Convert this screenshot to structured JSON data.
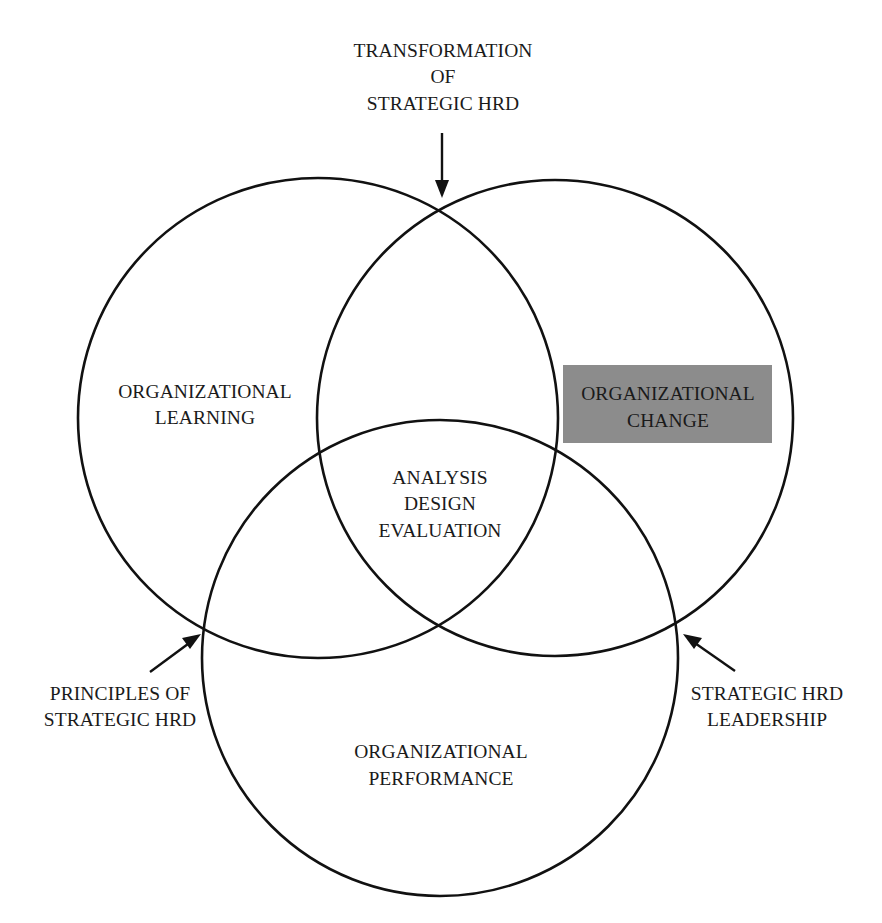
{
  "diagram": {
    "type": "venn",
    "circles": [
      {
        "id": "learning",
        "label_lines": [
          "ORGANIZATIONAL",
          "LEARNING"
        ],
        "cx": 318,
        "cy": 418,
        "r": 240
      },
      {
        "id": "change",
        "label_lines": [
          "ORGANIZATIONAL",
          "CHANGE"
        ],
        "cx": 555,
        "cy": 418,
        "r": 238,
        "highlighted": true
      },
      {
        "id": "performance",
        "label_lines": [
          "ORGANIZATIONAL",
          "PERFORMANCE"
        ],
        "cx": 440,
        "cy": 658,
        "r": 238
      }
    ],
    "center": {
      "label_lines": [
        "ANALYSIS",
        "DESIGN",
        "EVALUATION"
      ]
    },
    "annotations": {
      "top": {
        "label_lines": [
          "TRANSFORMATION",
          "OF",
          "STRATEGIC HRD"
        ]
      },
      "left": {
        "label_lines": [
          "PRINCIPLES OF",
          "STRATEGIC HRD"
        ]
      },
      "right": {
        "label_lines": [
          "STRATEGIC HRD",
          "LEADERSHIP"
        ]
      }
    },
    "colors": {
      "line": "#111111",
      "text": "#1a1a1a",
      "highlight_fill": "#8c8c8c",
      "background": "#ffffff"
    }
  }
}
